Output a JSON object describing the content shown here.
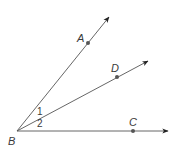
{
  "diagram": {
    "type": "geometry-angles",
    "vertex": {
      "label": "B",
      "x": 17,
      "y": 131
    },
    "rays": [
      {
        "name": "BA",
        "point_label": "A",
        "point": {
          "x": 88,
          "y": 43
        },
        "end": {
          "x": 109,
          "y": 17
        }
      },
      {
        "name": "BD",
        "point_label": "D",
        "point": {
          "x": 117,
          "y": 77
        },
        "end": {
          "x": 148,
          "y": 61
        }
      },
      {
        "name": "BC",
        "point_label": "C",
        "point": {
          "x": 133,
          "y": 131
        },
        "end": {
          "x": 168,
          "y": 131
        }
      }
    ],
    "angle_labels": [
      {
        "label": "1",
        "between": "BA-BD"
      },
      {
        "label": "2",
        "between": "BD-BC"
      }
    ],
    "colors": {
      "line": "#555555",
      "point": "#555555",
      "arrow": "#222222",
      "text": "#3a3a3a"
    }
  },
  "labels": {
    "A": "A",
    "B": "B",
    "C": "C",
    "D": "D",
    "angle1": "1",
    "angle2": "2"
  }
}
